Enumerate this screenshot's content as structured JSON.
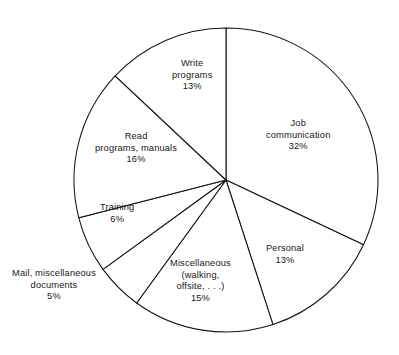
{
  "chart_data": {
    "type": "pie",
    "title": "",
    "subtitle": "",
    "xlabel": "",
    "ylabel": "",
    "legend": "none",
    "grid": false,
    "units": "percent",
    "total": 100,
    "start_angle_deg": 0,
    "direction": "clockwise",
    "categories": [
      "Job communication",
      "Personal",
      "Miscellaneous (walking, offsite, . . .)",
      "Mail, miscellaneous documents",
      "Training",
      "Read programs, manuals",
      "Write programs"
    ],
    "values": [
      32,
      13,
      15,
      5,
      6,
      16,
      13
    ],
    "slices": [
      {
        "id": "job-communication",
        "value": 32,
        "percent_text": "32%",
        "label_lines": [
          "Job",
          "communication"
        ],
        "label_x": 266,
        "label_y": 118,
        "label_align": "center",
        "start_deg": 0,
        "end_deg": 115.2
      },
      {
        "id": "personal",
        "value": 13,
        "percent_text": "13%",
        "label_lines": [
          "Personal"
        ],
        "label_x": 266,
        "label_y": 243,
        "label_align": "center",
        "start_deg": 115.2,
        "end_deg": 162
      },
      {
        "id": "miscellaneous",
        "value": 15,
        "percent_text": "15%",
        "label_lines": [
          "Miscellaneous",
          "(walking,",
          "offsite, . . .)"
        ],
        "label_x": 170,
        "label_y": 258,
        "label_align": "center",
        "start_deg": 162,
        "end_deg": 216
      },
      {
        "id": "mail-miscellaneous-documents",
        "value": 5,
        "percent_text": "5%",
        "label_lines": [
          "Mail, miscellaneous",
          "documents"
        ],
        "label_x": 12,
        "label_y": 268,
        "label_align": "center",
        "start_deg": 216,
        "end_deg": 234
      },
      {
        "id": "training",
        "value": 6,
        "percent_text": "6%",
        "label_lines": [
          "Training"
        ],
        "label_x": 100,
        "label_y": 202,
        "label_align": "center",
        "start_deg": 234,
        "end_deg": 255.6
      },
      {
        "id": "read-programs-manuals",
        "value": 16,
        "percent_text": "16%",
        "label_lines": [
          "Read",
          "programs, manuals"
        ],
        "label_x": 95,
        "label_y": 131,
        "label_align": "center",
        "start_deg": 255.6,
        "end_deg": 313.2
      },
      {
        "id": "write-programs",
        "value": 13,
        "percent_text": "13%",
        "label_lines": [
          "Write",
          "programs"
        ],
        "label_x": 172,
        "label_y": 58,
        "label_align": "center",
        "start_deg": 313.2,
        "end_deg": 360
      }
    ],
    "geometry": {
      "center_x": 226,
      "center_y": 180,
      "radius": 152
    },
    "style": {
      "stroke_color": "#141414",
      "fill_color": "#ffffff",
      "background": "#ffffff",
      "text_color": "#171717"
    }
  }
}
